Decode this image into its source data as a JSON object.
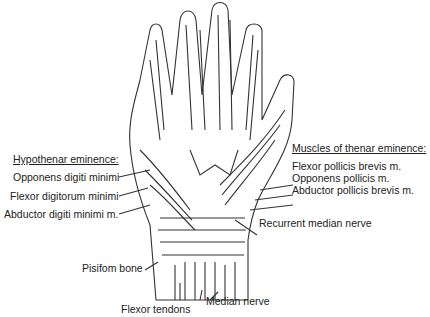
{
  "diagram": {
    "left_group": {
      "heading": "Hypothenar eminence:",
      "items": [
        "Opponens digiti minimi",
        "Flexor digitorum minimi",
        "Abductor digiti minimi m."
      ]
    },
    "right_group": {
      "heading": "Muscles of thenar eminence:",
      "items": [
        "Flexor pollicis brevis m.",
        "Opponens pollicis m.",
        "Abductor pollicis brevis m."
      ]
    },
    "other_labels": {
      "recurrent_median_nerve": "Recurrent median nerve",
      "pisiform_bone": "Pisifom bone",
      "flexor_tendons": "Flexor tendons",
      "median_nerve": "Median nerve"
    }
  }
}
